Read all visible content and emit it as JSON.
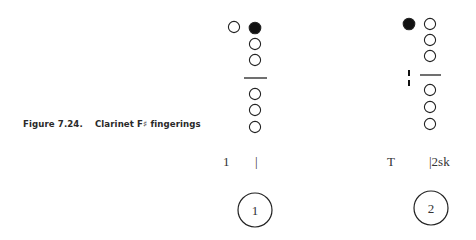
{
  "figure": {
    "number": "Figure 7.24.",
    "title": "Clarinet F♯ fingerings"
  },
  "fingerings": [
    {
      "id": 1,
      "number_label": "1",
      "thumb": {
        "state": "open",
        "cx": 234,
        "cy": 27
      },
      "upper_holes": [
        {
          "state": "closed",
          "cx": 255,
          "cy": 28
        },
        {
          "state": "open",
          "cx": 255,
          "cy": 44
        },
        {
          "state": "open",
          "cx": 255,
          "cy": 60
        }
      ],
      "divider": {
        "x1": 244,
        "x2": 267,
        "y": 78
      },
      "lower_holes": [
        {
          "state": "open",
          "cx": 255,
          "cy": 94
        },
        {
          "state": "open",
          "cx": 255,
          "cy": 110
        },
        {
          "state": "open",
          "cx": 255,
          "cy": 127
        }
      ],
      "side_mark": null,
      "left_key_label": "1",
      "right_key_label": "|",
      "badge": {
        "cx": 255,
        "cy": 210
      }
    },
    {
      "id": 2,
      "number_label": "2",
      "thumb": {
        "state": "closed",
        "cx": 409,
        "cy": 24
      },
      "upper_holes": [
        {
          "state": "open",
          "cx": 430,
          "cy": 24
        },
        {
          "state": "open",
          "cx": 430,
          "cy": 40
        },
        {
          "state": "open",
          "cx": 430,
          "cy": 56
        }
      ],
      "divider": {
        "x1": 420,
        "x2": 441,
        "y": 75
      },
      "lower_holes": [
        {
          "state": "open",
          "cx": 430,
          "cy": 90
        },
        {
          "state": "open",
          "cx": 430,
          "cy": 107
        },
        {
          "state": "open",
          "cx": 430,
          "cy": 124
        }
      ],
      "side_mark": {
        "type": "sliver-key",
        "x": 409,
        "y1": 70,
        "y2": 86
      },
      "left_key_label": "T",
      "right_key_label": "|2sk",
      "badge": {
        "cx": 431,
        "cy": 208
      }
    }
  ],
  "colors": {
    "ink": "#222222",
    "background": "#ffffff"
  }
}
